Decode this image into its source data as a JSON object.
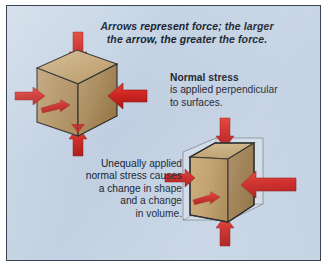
{
  "figure": {
    "background_color": "#c6d4e4",
    "frame_color": "#3a4450",
    "arrow_color": "#cc2320",
    "block_face_color": "#c4a36e",
    "block_edge_color": "#2b2b2b"
  },
  "captions": {
    "top": {
      "line1": "Arrows represent force; the larger",
      "line2": "the arrow, the greater the force."
    },
    "normal_stress": {
      "heading": "Normal stress",
      "line1": "is applied perpendicular",
      "line2": "to surfaces."
    },
    "unequal_stress": {
      "line1": "Unequally applied",
      "line2": "normal stress causes",
      "line3": "a change in shape",
      "line4": "and a change",
      "line5": "in volume."
    }
  },
  "diagrams": [
    {
      "name": "uniform-normal-stress-cube",
      "shape": "cube",
      "arrows": [
        {
          "side": "top",
          "direction": "down",
          "size": "small"
        },
        {
          "side": "bottom",
          "direction": "up",
          "size": "small"
        },
        {
          "side": "left",
          "direction": "right",
          "size": "small"
        },
        {
          "side": "right",
          "direction": "left",
          "size": "large"
        },
        {
          "side": "front",
          "direction": "into",
          "size": "small"
        }
      ]
    },
    {
      "name": "unequal-normal-stress-deformed-block",
      "shape": "deformed-block",
      "ghost_outline": "original cube outline",
      "arrows": [
        {
          "side": "top",
          "direction": "down",
          "size": "small"
        },
        {
          "side": "bottom",
          "direction": "up",
          "size": "small"
        },
        {
          "side": "left",
          "direction": "right",
          "size": "small"
        },
        {
          "side": "right",
          "direction": "left",
          "size": "large"
        },
        {
          "side": "front",
          "direction": "into",
          "size": "small"
        }
      ]
    }
  ]
}
